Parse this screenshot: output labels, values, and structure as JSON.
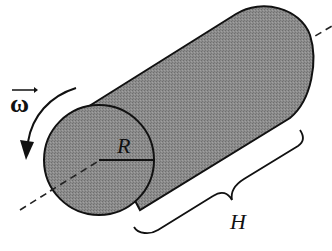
{
  "diagram": {
    "labels": {
      "radius": "R",
      "height": "H",
      "angular_velocity": "ω"
    },
    "colors": {
      "body_fill": "#8a8a8a",
      "outline": "#111111",
      "background": "#ffffff"
    },
    "elements": [
      {
        "name": "cylinder-body",
        "description": "solid cylinder viewed in perspective, axis tilted up-right"
      },
      {
        "name": "front-face",
        "description": "circular front face"
      },
      {
        "name": "radius-line",
        "label": "R"
      },
      {
        "name": "rotation-axis",
        "style": "dashed"
      },
      {
        "name": "rotation-arrow",
        "label": "ω (vector)",
        "direction": "counter-clockwise, pointing down"
      },
      {
        "name": "height-brace",
        "label": "H"
      }
    ]
  }
}
